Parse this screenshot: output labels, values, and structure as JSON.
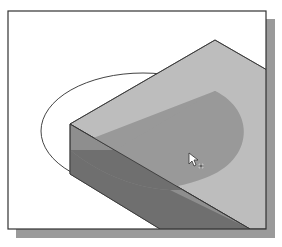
{
  "figure": {
    "colors": {
      "background": "#ffffff",
      "frame_border": "#333333",
      "frame_shadow": "#9a9a9a",
      "top_face": "#bdbdbd",
      "side_face": "#8e8e8e",
      "semicircle_on_top": "#999999",
      "semicircle_on_side": "#6f6f6f",
      "ellipse_stroke": "#444444",
      "edge_stroke": "#333333"
    },
    "cursor": {
      "icon": "arrow-pointer-with-plus-icon",
      "x": 189,
      "y": 153
    }
  }
}
